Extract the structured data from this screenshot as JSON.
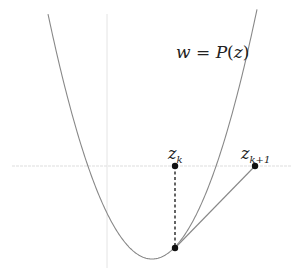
{
  "diagram": {
    "curve_label": {
      "var": "w",
      "eq": " = ",
      "func": "P",
      "open": "(",
      "arg": "z",
      "close": ")"
    },
    "points": [
      {
        "name": "z_k",
        "base": "z",
        "sub": "k",
        "x": 175,
        "y": 166,
        "role": "current-iterate"
      },
      {
        "name": "z_{k+1}",
        "base": "z",
        "sub": "k+1",
        "x": 255,
        "y": 166,
        "role": "next-iterate"
      },
      {
        "name": "P(z_k)",
        "x": 175,
        "y": 248,
        "role": "curve-point"
      }
    ],
    "axes": {
      "horizontal_y": 166,
      "vertical_x": 107,
      "color": "#dddddd"
    },
    "curve": {
      "type": "parabola",
      "vertex": [
        152,
        259
      ],
      "coefficient": 0.02265,
      "x_range": [
        48,
        257
      ],
      "color": "#888888"
    },
    "colors": {
      "points": "#111111",
      "tangent": "#888888",
      "dashed": "#222222"
    }
  }
}
